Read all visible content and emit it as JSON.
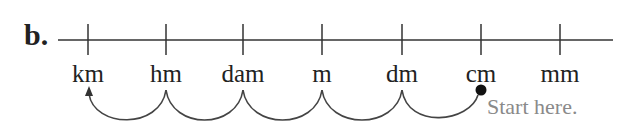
{
  "part_label": "b.",
  "units": [
    {
      "label": "km",
      "x": 88
    },
    {
      "label": "hm",
      "x": 166
    },
    {
      "label": "dam",
      "x": 243
    },
    {
      "label": "m",
      "x": 322
    },
    {
      "label": "dm",
      "x": 402
    },
    {
      "label": "cm",
      "x": 481
    },
    {
      "label": "mm",
      "x": 560
    }
  ],
  "start_unit": "cm",
  "end_unit": "km",
  "start_note": "Start here.",
  "colors": {
    "ink": "#222222",
    "note": "#8a8a8a"
  }
}
